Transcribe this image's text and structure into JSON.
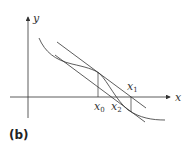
{
  "figure": {
    "caption": "(b)",
    "axes": {
      "x_label": "x",
      "y_label": "y"
    },
    "points": [
      {
        "name": "x",
        "sub": "0"
      },
      {
        "name": "x",
        "sub": "2"
      },
      {
        "name": "x",
        "sub": "1"
      }
    ],
    "colors": {
      "line": "#333333",
      "background": "#ffffff"
    }
  }
}
